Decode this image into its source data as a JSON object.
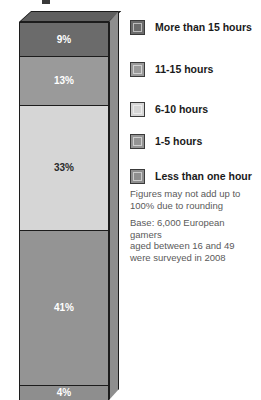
{
  "chart_data": {
    "type": "bar",
    "subtype": "stacked-vertical-3d-single-column",
    "title": "",
    "xlabel": "",
    "ylabel": "",
    "ylim": [
      0,
      100
    ],
    "grid": false,
    "categories": [
      "All gamers"
    ],
    "stack_order_top_to_bottom": [
      "More than 15 hours",
      "11-15 hours",
      "6-10 hours",
      "1-5 hours",
      "Less than one hour"
    ],
    "series": [
      {
        "name": "More than 15 hours",
        "values": [
          9
        ],
        "label": "9%",
        "color": "#6b6b6b",
        "label_color": "#ffffff"
      },
      {
        "name": "11-15 hours",
        "values": [
          13
        ],
        "label": "13%",
        "color": "#9a9a9a",
        "label_color": "#ffffff"
      },
      {
        "name": "6-10 hours",
        "values": [
          33
        ],
        "label": "33%",
        "color": "#d6d6d6",
        "label_color": "#2a2a2a"
      },
      {
        "name": "1-5 hours",
        "values": [
          41
        ],
        "label": "41%",
        "color": "#949494",
        "label_color": "#ffffff"
      },
      {
        "name": "Less than one hour",
        "values": [
          4
        ],
        "label": "4%",
        "color": "#8e8e8e",
        "label_color": "#ffffff"
      }
    ],
    "annotations": [
      "Figures may not add up to 100% due to rounding",
      "Base: 6,000 European gamers aged between 16 and 49 were surveyed in 2008"
    ],
    "legend_position": "right"
  },
  "legend": {
    "items": [
      {
        "label": "More than 15 hours",
        "color": "#6b6b6b"
      },
      {
        "label": "11-15 hours",
        "color": "#9a9a9a"
      },
      {
        "label": "6-10 hours",
        "color": "#d6d6d6"
      },
      {
        "label": "1-5 hours",
        "color": "#949494"
      },
      {
        "label": "Less than one hour",
        "color": "#8e8e8e"
      }
    ]
  },
  "notes": {
    "line1": "Figures may not add up to",
    "line2": "100% due to rounding",
    "line3": "Base: 6,000 European gamers",
    "line4": "aged between 16 and 49",
    "line5": "were surveyed in 2008"
  },
  "colors": {
    "more_than_15": "#6b6b6b",
    "hours_11_15": "#9a9a9a",
    "hours_6_10": "#d6d6d6",
    "hours_1_5": "#949494",
    "less_than_one": "#8e8e8e",
    "outline": "#1c1c1c",
    "bar_top_face": "#5f5f5f",
    "bar_side_face": "#8e8e8e",
    "note_text": "#5a5a5a",
    "legend_text": "#1a1a1a",
    "background": "#ffffff"
  }
}
